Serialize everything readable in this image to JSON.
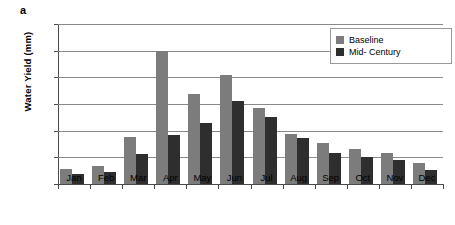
{
  "panel": {
    "label": "a"
  },
  "chart_data": {
    "type": "bar",
    "title": "",
    "xlabel": "",
    "ylabel": "Water Yield (mm)",
    "ylim": [
      0,
      60
    ],
    "yticks": [
      0,
      10,
      20,
      30,
      40,
      50,
      60
    ],
    "grid": true,
    "legend_position": "top-right",
    "categories": [
      "Jan",
      "Feb",
      "Mar",
      "Apr",
      "May",
      "Jun",
      "Jul",
      "Aug",
      "Sep",
      "Oct",
      "Nov",
      "Dec"
    ],
    "series": [
      {
        "name": "Baseline",
        "color": "#7c7c7c",
        "values": [
          5.8,
          6.8,
          17.7,
          49.7,
          33.8,
          40.7,
          28.5,
          18.8,
          15.5,
          13.3,
          11.7,
          8.0
        ]
      },
      {
        "name": "Mid- Century",
        "color": "#2e2e2e",
        "values": [
          3.6,
          4.5,
          11.2,
          18.4,
          22.8,
          31.0,
          25.0,
          17.3,
          11.5,
          10.2,
          9.0,
          5.2
        ]
      }
    ]
  }
}
